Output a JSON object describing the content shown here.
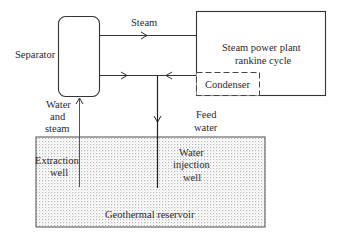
{
  "diagram": {
    "type": "geothermal power plant schematic",
    "nodes": {
      "separator": {
        "label": "Separator"
      },
      "power_plant": {
        "label_line1": "Steam power plant",
        "label_line2": "rankine cycle"
      },
      "condenser": {
        "label": "Condenser"
      },
      "reservoir": {
        "label": "Geothermal reservoir"
      },
      "extraction_well": {
        "label_line1": "Extraction",
        "label_line2": "well"
      },
      "injection_well": {
        "label_line1": "Water",
        "label_line2": "injection",
        "label_line3": "well"
      }
    },
    "flows": {
      "steam": {
        "label": "Steam"
      },
      "water_and_steam": {
        "label_line1": "Water",
        "label_line2": "and",
        "label_line3": "steam"
      },
      "feed_water": {
        "label_line1": "Feed",
        "label_line2": "water"
      }
    },
    "edges": [
      {
        "from": "Geothermal reservoir",
        "to": "Separator",
        "via": "Extraction well",
        "label": "Water and steam"
      },
      {
        "from": "Separator",
        "to": "Steam power plant rankine cycle",
        "label": "Steam"
      },
      {
        "from": "Separator",
        "to": "Water injection well",
        "label": "Water"
      },
      {
        "from": "Condenser",
        "to": "Water injection well",
        "label": "Feed water"
      },
      {
        "from": "Water injection well",
        "to": "Geothermal reservoir"
      }
    ]
  }
}
